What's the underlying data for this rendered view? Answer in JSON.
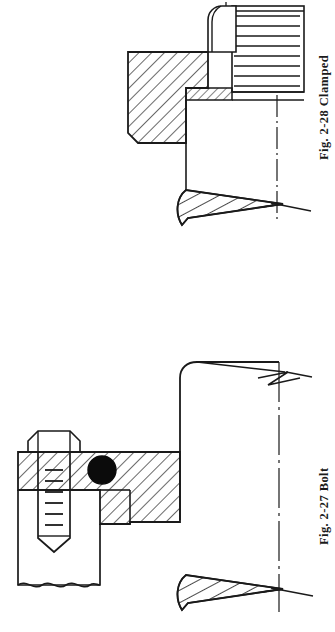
{
  "page": {
    "background_color": "#ffffff",
    "ink_color": "#1a1a1a",
    "width": 335,
    "height": 632,
    "kind": "engineering-drawing-scan",
    "orientation": "figures rotated 90 degrees (captions read bottom-to-top)"
  },
  "figures": [
    {
      "id": "fig-2-28",
      "caption_number": "Fig. 2-28",
      "caption_title": "Clamped",
      "caption_full": "Fig. 2-28   Clamped",
      "position": "top",
      "parts": [
        "hatched clamp block (section)",
        "rounded nut / bolt head",
        "threaded stud with horizontal thread lines",
        "thin hatched washer strip",
        "dash-dot centerline",
        "tapered hatched shaft end"
      ]
    },
    {
      "id": "fig-2-27",
      "caption_number": "Fig. 2-27",
      "caption_title": "Bolt",
      "caption_full": "Fig. 2-27   Bolt",
      "position": "bottom",
      "parts": [
        "hex bolt head",
        "threaded shank with chamfered tip",
        "solid black O-ring seal in section",
        "hatched flange block (section)",
        "large rounded body with zigzag break line",
        "wavy break line on base",
        "dash-dot centerline",
        "tapered hatched shaft end"
      ]
    }
  ],
  "annotations": {
    "hatch_angle_deg": 45,
    "centerline_style": "dash-dot",
    "break_line_styles": [
      "zigzag",
      "wavy"
    ]
  }
}
